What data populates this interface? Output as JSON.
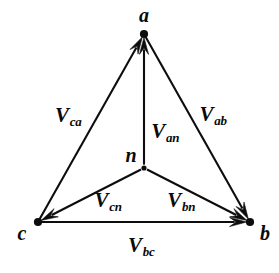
{
  "figure": {
    "kind": "phasor-vector-diagram",
    "background_color": "#ffffff",
    "stroke_color": "#0d0d0d",
    "width": 279,
    "height": 273
  },
  "nodes": [
    {
      "id": "a",
      "label": "a",
      "x": 144,
      "y": 34,
      "label_x": 144,
      "label_y": 15,
      "dot": true
    },
    {
      "id": "b",
      "label": "b",
      "x": 250,
      "y": 222,
      "label_x": 265,
      "label_y": 233,
      "dot": true
    },
    {
      "id": "c",
      "label": "c",
      "x": 38,
      "y": 222,
      "label_x": 22,
      "label_y": 233,
      "dot": true
    },
    {
      "id": "n",
      "label": "n",
      "x": 144,
      "y": 168,
      "label_x": 131,
      "label_y": 155,
      "dot": false
    }
  ],
  "vectors": [
    {
      "id": "v-ca",
      "main": "V",
      "sub": "ca",
      "from": "c",
      "to": "a",
      "arrow_at": "a",
      "label_x": 68,
      "label_y": 115
    },
    {
      "id": "v-ab",
      "main": "V",
      "sub": "ab",
      "from": "a",
      "to": "b",
      "arrow_at": "b",
      "label_x": 213,
      "label_y": 114
    },
    {
      "id": "v-an",
      "main": "V",
      "sub": "an",
      "from": "n",
      "to": "a",
      "arrow_at": "a",
      "label_x": 165,
      "label_y": 131
    },
    {
      "id": "v-cn",
      "main": "V",
      "sub": "cn",
      "from": "n",
      "to": "c",
      "arrow_at": "c",
      "label_x": 108,
      "label_y": 200
    },
    {
      "id": "v-bn",
      "main": "V",
      "sub": "bn",
      "from": "n",
      "to": "b",
      "arrow_at": "b",
      "label_x": 181,
      "label_y": 200
    },
    {
      "id": "v-bc",
      "main": "V",
      "sub": "bc",
      "from": "c",
      "to": "b",
      "arrow_at": "b",
      "label_x": 141,
      "label_y": 245
    }
  ]
}
